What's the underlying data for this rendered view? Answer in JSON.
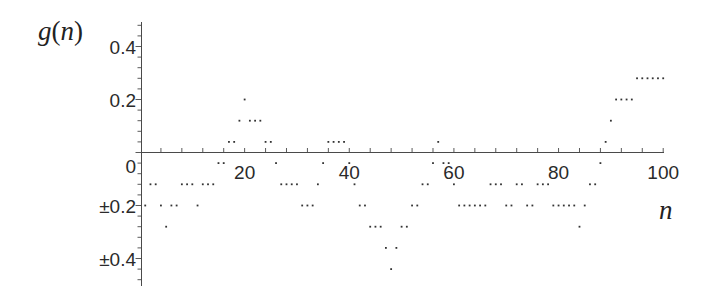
{
  "chart_data": {
    "type": "scatter",
    "title": "",
    "xlabel": "n",
    "ylabel": "g(n)",
    "xlim": [
      0,
      100
    ],
    "ylim": [
      -0.5,
      0.49
    ],
    "grid": false,
    "legend": null,
    "x_ticks": [
      20,
      40,
      60,
      80,
      100
    ],
    "x_tick_labels": [
      "20",
      "40",
      "60",
      "80",
      "100"
    ],
    "x_minor_tick_step": 4,
    "y_ticks": [
      0.4,
      0.2,
      0,
      -0.2,
      -0.4
    ],
    "y_tick_labels": [
      "0.4",
      "0.2",
      "0",
      "±0.2",
      "±0.4"
    ],
    "y_minor_tick_step": 0.04,
    "series": [
      {
        "name": "g(n)",
        "marker": "dot",
        "color": "#333333",
        "x": [
          1,
          2,
          3,
          4,
          5,
          6,
          7,
          8,
          9,
          10,
          11,
          12,
          13,
          14,
          15,
          16,
          17,
          18,
          19,
          20,
          21,
          22,
          23,
          24,
          25,
          26,
          27,
          28,
          29,
          30,
          31,
          32,
          33,
          34,
          35,
          36,
          37,
          38,
          39,
          40,
          41,
          42,
          43,
          44,
          45,
          46,
          47,
          48,
          49,
          50,
          51,
          52,
          53,
          54,
          55,
          56,
          57,
          58,
          59,
          60,
          61,
          62,
          63,
          64,
          65,
          66,
          67,
          68,
          69,
          70,
          71,
          72,
          73,
          74,
          75,
          76,
          77,
          78,
          79,
          80,
          81,
          82,
          83,
          84,
          85,
          86,
          87,
          88,
          89,
          90,
          91,
          92,
          93,
          94,
          95,
          96,
          97,
          98,
          99,
          100
        ],
        "values": [
          -0.2,
          -0.12,
          -0.12,
          -0.2,
          -0.28,
          -0.2,
          -0.2,
          -0.12,
          -0.12,
          -0.12,
          -0.2,
          -0.12,
          -0.12,
          -0.12,
          -0.04,
          -0.04,
          0.04,
          0.04,
          0.12,
          0.2,
          0.12,
          0.12,
          0.12,
          0.04,
          0.04,
          -0.04,
          -0.12,
          -0.12,
          -0.12,
          -0.12,
          -0.2,
          -0.2,
          -0.2,
          -0.12,
          -0.04,
          0.04,
          0.04,
          0.04,
          0.04,
          -0.04,
          -0.12,
          -0.2,
          -0.2,
          -0.28,
          -0.28,
          -0.28,
          -0.36,
          -0.44,
          -0.36,
          -0.28,
          -0.28,
          -0.2,
          -0.2,
          -0.12,
          -0.12,
          -0.04,
          0.04,
          -0.04,
          -0.04,
          -0.12,
          -0.2,
          -0.2,
          -0.2,
          -0.2,
          -0.2,
          -0.2,
          -0.12,
          -0.12,
          -0.12,
          -0.2,
          -0.2,
          -0.12,
          -0.12,
          -0.2,
          -0.2,
          -0.12,
          -0.12,
          -0.12,
          -0.2,
          -0.2,
          -0.2,
          -0.2,
          -0.2,
          -0.28,
          -0.2,
          -0.12,
          -0.12,
          -0.04,
          0.04,
          0.12,
          0.2,
          0.2,
          0.2,
          0.2,
          0.28,
          0.28,
          0.28,
          0.28,
          0.28,
          0.28
        ]
      }
    ]
  },
  "labels": {
    "y_title_g": "g",
    "y_title_open": "(",
    "y_title_n": "n",
    "y_title_close": ")",
    "x_title": "n"
  }
}
